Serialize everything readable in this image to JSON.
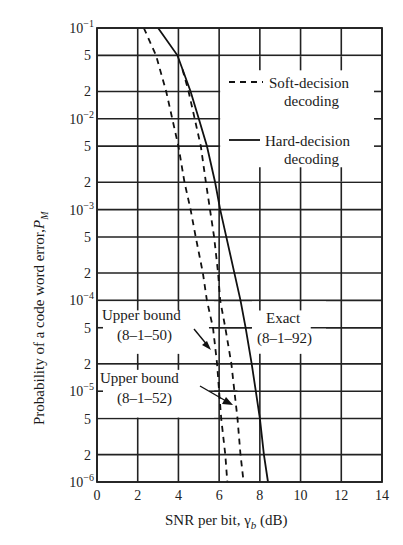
{
  "chart_data": {
    "type": "line",
    "title": "",
    "xlabel": "SNR per bit, γ_b (dB)",
    "xlabel_parts": {
      "main": "SNR per bit, ",
      "symbol": "γ",
      "subscript": "b",
      "unit": " (dB)"
    },
    "ylabel": "Probability of a code word error, P_M",
    "ylabel_parts": {
      "main": "Probability of a code word error,",
      "symbol": "P",
      "subscript": "M"
    },
    "xlim": [
      0,
      14
    ],
    "ylim": [
      1e-06,
      0.1
    ],
    "yscale": "log",
    "grid": true,
    "x_ticks": [
      0,
      2,
      4,
      6,
      8,
      10,
      12,
      14
    ],
    "x_tick_labels": [
      "0",
      "2",
      "4",
      "6",
      "8",
      "10",
      "12",
      "14"
    ],
    "y_ticks": [
      {
        "value": 0.1,
        "label": "10",
        "exp": "−1"
      },
      {
        "value": 0.05,
        "label": "5",
        "exp": ""
      },
      {
        "value": 0.02,
        "label": "2",
        "exp": ""
      },
      {
        "value": 0.01,
        "label": "10",
        "exp": "−2"
      },
      {
        "value": 0.005,
        "label": "5",
        "exp": ""
      },
      {
        "value": 0.002,
        "label": "2",
        "exp": ""
      },
      {
        "value": 0.001,
        "label": "10",
        "exp": "−3"
      },
      {
        "value": 0.0005,
        "label": "5",
        "exp": ""
      },
      {
        "value": 0.0002,
        "label": "2",
        "exp": ""
      },
      {
        "value": 0.0001,
        "label": "10",
        "exp": "−4"
      },
      {
        "value": 5e-05,
        "label": "5",
        "exp": ""
      },
      {
        "value": 2e-05,
        "label": "2",
        "exp": ""
      },
      {
        "value": 1e-05,
        "label": "10",
        "exp": "−5"
      },
      {
        "value": 5e-06,
        "label": "5",
        "exp": ""
      },
      {
        "value": 2e-06,
        "label": "2",
        "exp": ""
      },
      {
        "value": 1e-06,
        "label": "10",
        "exp": "−6"
      }
    ],
    "legend": {
      "position": "upper right",
      "entries": [
        {
          "style": "dashed",
          "label_line1": "Soft-decision",
          "label_line2": "decoding"
        },
        {
          "style": "solid",
          "label_line1": "Hard-decision",
          "label_line2": "decoding"
        }
      ]
    },
    "series": [
      {
        "name": "Upper bound (8-1-50)",
        "style": "dashed",
        "x": [
          2.3,
          2.9,
          3.4,
          3.7,
          4.0,
          4.3,
          4.6,
          4.85,
          5.2,
          5.4,
          5.7,
          5.9,
          6.0,
          6.1,
          6.3,
          6.4
        ],
        "y": [
          0.1,
          0.05,
          0.02,
          0.01,
          0.005,
          0.002,
          0.001,
          0.0005,
          0.0002,
          0.0001,
          5e-05,
          2e-05,
          1e-05,
          5e-06,
          2e-06,
          1e-06
        ]
      },
      {
        "name": "Upper bound (8-1-52)",
        "style": "dashed",
        "x": [
          4.2,
          4.5,
          4.8,
          5.1,
          5.35,
          5.55,
          5.75,
          5.95,
          6.05,
          6.3,
          6.6,
          6.75,
          6.9,
          7.05,
          7.2
        ],
        "y": [
          0.035,
          0.02,
          0.01,
          0.005,
          0.002,
          0.001,
          0.0005,
          0.0002,
          0.0001,
          5e-05,
          2e-05,
          1e-05,
          5e-06,
          2e-06,
          1e-06
        ]
      },
      {
        "name": "Exact (8-1-92)",
        "style": "solid",
        "x": [
          3.0,
          3.95,
          4.6,
          5.0,
          5.4,
          5.8,
          6.05,
          6.35,
          6.75,
          7.05,
          7.3,
          7.6,
          7.8,
          8.0,
          8.2,
          8.4
        ],
        "y": [
          0.1,
          0.05,
          0.02,
          0.01,
          0.005,
          0.002,
          0.001,
          0.0005,
          0.0002,
          0.0001,
          5e-05,
          2e-05,
          1e-05,
          5e-06,
          2e-06,
          1e-06
        ]
      }
    ],
    "annotations": [
      {
        "id": "ub50",
        "line1": "Upper bound",
        "line2": "(8–1–50)",
        "arrow_to": {
          "x": 5.75,
          "y": 3.2e-05
        }
      },
      {
        "id": "ub52",
        "line1": "Upper bound",
        "line2": "(8–1–52)",
        "arrow_to": {
          "x": 6.8,
          "y": 8.5e-06
        }
      },
      {
        "id": "exact",
        "line1": "Exact",
        "line2": "(8–1–92)",
        "arrow_to": null
      }
    ]
  },
  "labels": {
    "legend_soft_1": "Soft-decision",
    "legend_soft_2": "decoding",
    "legend_hard_1": "Hard-decision",
    "legend_hard_2": "decoding",
    "ann_ub50_1": "Upper bound",
    "ann_ub50_2": "(8–1–50)",
    "ann_ub52_1": "Upper bound",
    "ann_ub52_2": "(8–1–52)",
    "ann_exact_1": "Exact",
    "ann_exact_2": "(8–1–92)",
    "xlabel_main": "SNR per bit, ",
    "xlabel_sym": "γ",
    "xlabel_sub": "b",
    "xlabel_unit": " (dB)",
    "ylabel_main": "Probability of a code word error,",
    "ylabel_sym": "P",
    "ylabel_sub": "M"
  }
}
